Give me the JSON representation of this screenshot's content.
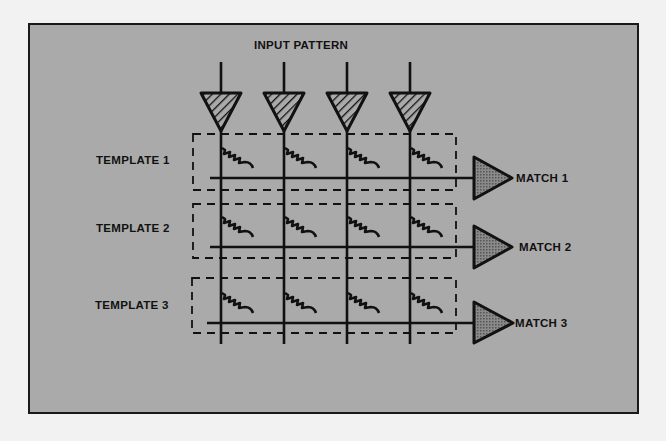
{
  "diagram": {
    "title": "INPUT PATTERN",
    "templates": [
      {
        "label": "TEMPLATE 1",
        "output": "MATCH 1"
      },
      {
        "label": "TEMPLATE 2",
        "output": "MATCH 2"
      },
      {
        "label": "TEMPLATE 3",
        "output": "MATCH 3"
      }
    ],
    "input_count": 4,
    "colors": {
      "background": "#aaaaaa",
      "page": "#f2f2f2",
      "ink": "#111111",
      "amplifier_fill": "#777777"
    }
  }
}
